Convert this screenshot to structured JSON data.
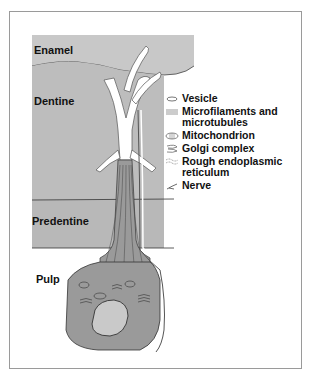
{
  "figure": {
    "type": "odontoblast cell diagram",
    "regions": [
      {
        "id": "enamel",
        "label": "Enamel"
      },
      {
        "id": "dentine",
        "label": "Dentine"
      },
      {
        "id": "predentine",
        "label": "Predentine"
      },
      {
        "id": "pulp",
        "label": "Pulp"
      }
    ],
    "legend": [
      {
        "icon": "vesicle-icon",
        "label": "Vesicle"
      },
      {
        "icon": "microfilaments-icon",
        "label": "Microfilaments and microtubules"
      },
      {
        "icon": "mitochondrion-icon",
        "label": "Mitochondrion"
      },
      {
        "icon": "golgi-icon",
        "label": "Golgi complex"
      },
      {
        "icon": "rough-er-icon",
        "label": "Rough endoplasmic reticulum"
      },
      {
        "icon": "nerve-icon",
        "label": "Nerve"
      }
    ],
    "colors": {
      "enamel": "#c8c8c8",
      "dentine": "#bdbdbd",
      "predentine": "#b8b8b8",
      "cell": "#9a9a9a",
      "nucleus": "#c9c9c9",
      "tubule": "#ffffff",
      "outline": "#3a3a3a",
      "frame": "#9a9a9a"
    }
  }
}
